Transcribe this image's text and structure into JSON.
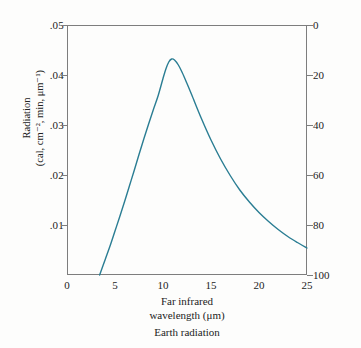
{
  "chart_data": {
    "type": "line",
    "title": "",
    "caption": "Earth radiation",
    "xlabel_line1": "Far infrared",
    "xlabel_line2": "wavelength (μm)",
    "ylabel_line1": "Radiation",
    "ylabel_line2": "(cal, cm⁻², min, μm⁻¹)",
    "ylabel_right": "",
    "grid": false,
    "legend": "none",
    "xlim": [
      0,
      25
    ],
    "ylim": [
      0,
      0.05
    ],
    "y2lim": [
      0,
      100
    ],
    "y2_inverted": true,
    "xticks": [
      0,
      5,
      10,
      15,
      20,
      25
    ],
    "xtick_labels": [
      "0",
      "5",
      "10",
      "15",
      "20",
      "25"
    ],
    "yticks": [
      0.01,
      0.02,
      0.03,
      0.04,
      0.05
    ],
    "ytick_labels": [
      ".01",
      ".02",
      ".03",
      ".04",
      ".05"
    ],
    "y2ticks": [
      0,
      20,
      40,
      60,
      80,
      100
    ],
    "y2tick_labels": [
      "0",
      "20",
      "40",
      "60",
      "80",
      "100"
    ],
    "curve_color": "#2a7d93",
    "frame_color": "#7d7d7d",
    "series": [
      {
        "name": "Earth radiation spectrum",
        "x": [
          3.4,
          4.0,
          4.5,
          5.0,
          5.5,
          6.0,
          6.5,
          7.0,
          7.5,
          8.0,
          8.5,
          9.0,
          9.5,
          10.0,
          10.3,
          10.6,
          10.9,
          11.2,
          11.6,
          12.0,
          12.5,
          13.0,
          14.0,
          15.0,
          16.0,
          17.0,
          18.0,
          19.0,
          20.0,
          21.0,
          22.0,
          23.0,
          24.0,
          25.0
        ],
        "y": [
          0.0,
          0.0032,
          0.0059,
          0.0088,
          0.0117,
          0.0147,
          0.0178,
          0.0209,
          0.0241,
          0.0272,
          0.0302,
          0.0331,
          0.0359,
          0.0393,
          0.0412,
          0.0426,
          0.0432,
          0.043,
          0.042,
          0.0405,
          0.0383,
          0.036,
          0.0313,
          0.027,
          0.0232,
          0.0199,
          0.017,
          0.0146,
          0.0125,
          0.0107,
          0.0091,
          0.0077,
          0.0065,
          0.0054
        ]
      }
    ],
    "peak": {
      "x": 10.9,
      "y": 0.0432
    },
    "onset": {
      "x": 3.4,
      "y": 0.0
    }
  },
  "axes": {
    "left_ticks": [
      {
        "label": ".05",
        "value": 0.05
      },
      {
        "label": ".04",
        "value": 0.04
      },
      {
        "label": ".03",
        "value": 0.03
      },
      {
        "label": ".02",
        "value": 0.02
      },
      {
        "label": ".01",
        "value": 0.01
      }
    ],
    "right_ticks": [
      {
        "label": "0",
        "value": 0
      },
      {
        "label": "20",
        "value": 20
      },
      {
        "label": "40",
        "value": 40
      },
      {
        "label": "60",
        "value": 60
      },
      {
        "label": "80",
        "value": 80
      },
      {
        "label": "100",
        "value": 100
      }
    ],
    "x_ticks": [
      {
        "label": "0",
        "value": 0
      },
      {
        "label": "5",
        "value": 5
      },
      {
        "label": "10",
        "value": 10
      },
      {
        "label": "15",
        "value": 15
      },
      {
        "label": "20",
        "value": 20
      },
      {
        "label": "25",
        "value": 25
      }
    ]
  },
  "labels": {
    "y_title_line1": "Radiation",
    "y_title_line2": "(cal, cm⁻², min, μm⁻¹)",
    "x_title_line1": "Far infrared",
    "x_title_line2": "wavelength (μm)",
    "caption": "Earth radiation"
  }
}
